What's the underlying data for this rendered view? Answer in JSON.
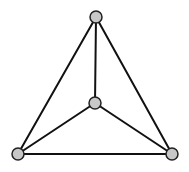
{
  "diagram": {
    "type": "graph",
    "node_fill": "#c8c8c8",
    "node_stroke": "#222222",
    "edge_color": "#111111",
    "nodes": [
      {
        "id": "top",
        "x": 96,
        "y": 17
      },
      {
        "id": "center",
        "x": 95,
        "y": 103
      },
      {
        "id": "bottom-left",
        "x": 18,
        "y": 154
      },
      {
        "id": "bottom-right",
        "x": 172,
        "y": 154
      }
    ],
    "edges": [
      [
        "top",
        "bottom-left"
      ],
      [
        "top",
        "bottom-right"
      ],
      [
        "top",
        "center"
      ],
      [
        "center",
        "bottom-left"
      ],
      [
        "center",
        "bottom-right"
      ],
      [
        "bottom-left",
        "bottom-right"
      ]
    ]
  }
}
